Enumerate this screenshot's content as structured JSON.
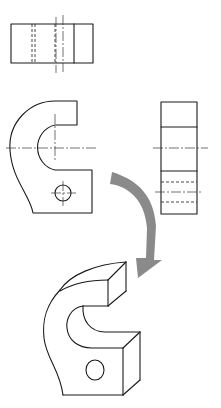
{
  "figure": {
    "views": [
      {
        "id": "top-view",
        "label": "Top view"
      },
      {
        "id": "front-view",
        "label": "Front view"
      },
      {
        "id": "side-view",
        "label": "Right side view"
      },
      {
        "id": "isometric-view",
        "label": "Isometric view"
      }
    ],
    "arrow": {
      "label": "Transform to isometric",
      "color": "#8a8a8a"
    },
    "colors": {
      "line": "#1a1a1a",
      "background": "#ffffff",
      "arrow": "#8a8a8a"
    }
  }
}
